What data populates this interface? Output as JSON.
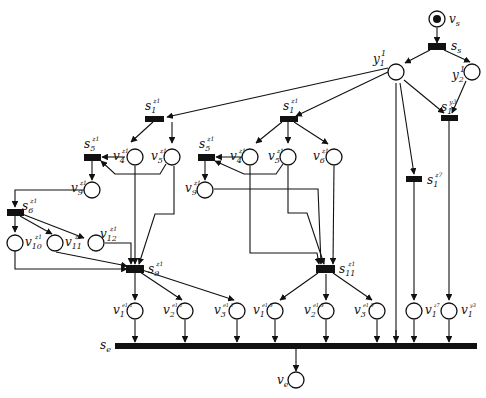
{
  "diagram": {
    "type": "petri-net",
    "places": {
      "vs": {
        "base": "v",
        "sub": "s",
        "sup": "",
        "marked": true
      },
      "y1": {
        "base": "y",
        "sub": "1",
        "sup": "1"
      },
      "y2": {
        "base": "y",
        "sub": "2",
        "sup": "1"
      },
      "A_v4": {
        "base": "v",
        "sub": "4",
        "sup": "z1"
      },
      "A_v5": {
        "base": "v",
        "sub": "5",
        "sup": "z1"
      },
      "A_v9": {
        "base": "v",
        "sub": "9",
        "sup": "z1"
      },
      "A_v10": {
        "base": "v",
        "sub": "10",
        "sup": "z1"
      },
      "A_v11": {
        "base": "v",
        "sub": "11",
        "sup": "z1"
      },
      "A_v12": {
        "base": "v",
        "sub": "12",
        "sup": "z1"
      },
      "B_v4": {
        "base": "v",
        "sub": "4",
        "sup": "z1"
      },
      "B_v5": {
        "base": "v",
        "sub": "5",
        "sup": "z1"
      },
      "B_v6": {
        "base": "v",
        "sub": "6",
        "sup": "z1"
      },
      "B_v9": {
        "base": "v",
        "sub": "9",
        "sup": "z1"
      },
      "o1": {
        "base": "v",
        "sub": "1",
        "sup": "e1,1"
      },
      "o2": {
        "base": "v",
        "sub": "2",
        "sup": "e1,1"
      },
      "o3": {
        "base": "v",
        "sub": "3",
        "sup": "e1,1"
      },
      "o4": {
        "base": "v",
        "sub": "1",
        "sup": "e1,3"
      },
      "o5": {
        "base": "v",
        "sub": "2",
        "sup": "e1,3"
      },
      "o6": {
        "base": "v",
        "sub": "3",
        "sup": "e1,3"
      },
      "o7": {
        "base": "v",
        "sub": "1",
        "sup": "z7"
      },
      "o8": {
        "base": "v",
        "sub": "1",
        "sup": "y3"
      },
      "ve": {
        "base": "v",
        "sub": "e",
        "sup": ""
      }
    },
    "transitions": {
      "ss": {
        "base": "s",
        "sub": "s",
        "sup": ""
      },
      "A_s1": {
        "base": "s",
        "sub": "1",
        "sup": "z1"
      },
      "A_s5": {
        "base": "s",
        "sub": "5",
        "sup": "z1"
      },
      "A_s6": {
        "base": "s",
        "sub": "6",
        "sup": "z1"
      },
      "A_s9": {
        "base": "s",
        "sub": "9",
        "sup": "z1"
      },
      "B_s1": {
        "base": "s",
        "sub": "1",
        "sup": "z1"
      },
      "B_s5": {
        "base": "s",
        "sub": "5",
        "sup": "z1"
      },
      "B_s11": {
        "base": "s",
        "sub": "11",
        "sup": "z1"
      },
      "s1z7": {
        "base": "s",
        "sub": "1",
        "sup": "z7"
      },
      "s1y3": {
        "base": "s",
        "sub": "1",
        "sup": "y3"
      },
      "se": {
        "base": "s",
        "sub": "e",
        "sup": ""
      }
    }
  }
}
